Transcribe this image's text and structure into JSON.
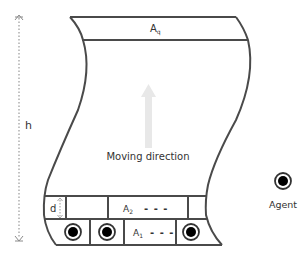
{
  "diagram": {
    "height_label": "h",
    "top_area": {
      "label": "A",
      "subscript": "q"
    },
    "moving_direction_label": "Moving direction",
    "d_label": "d",
    "row_upper": {
      "label": "A",
      "subscript": "2",
      "dashes": "- - -"
    },
    "row_lower": {
      "label": "A",
      "subscript": "1",
      "dashes": "- - -"
    },
    "legend": {
      "agent_label": "Agent"
    },
    "colors": {
      "outline": "#4a4a4a",
      "arrow": "#e6e6e6",
      "agent_fill": "#000000",
      "text": "#333333"
    }
  }
}
